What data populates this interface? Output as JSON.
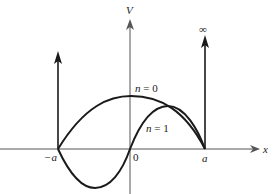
{
  "diagram": {
    "axes": {
      "x_label": "x",
      "y_label": "V"
    },
    "tick_labels": {
      "left": "−a",
      "center": "0",
      "right": "a"
    },
    "wall_label": "∞",
    "curves": [
      {
        "name": "n = 0",
        "label": "n = 0",
        "shape": "half cosine, single hump"
      },
      {
        "name": "n = 1",
        "label": "n = 1",
        "shape": "full sine period"
      }
    ],
    "colors": {
      "line": "#1a1a1a",
      "axis": "#555555",
      "background": "#ffffff"
    }
  }
}
